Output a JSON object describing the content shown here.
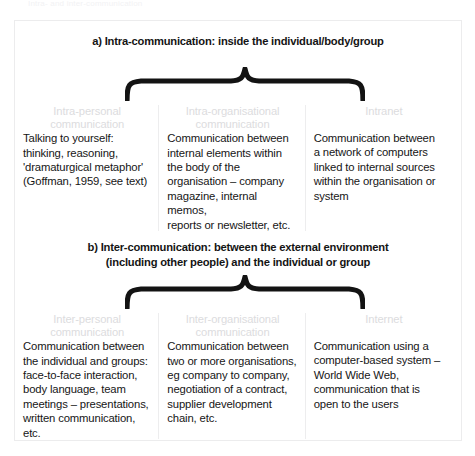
{
  "top_sliver": "Intra- and inter-communication",
  "figure": {
    "sections": [
      {
        "id": "a",
        "heading": "a) Intra-communication: inside the individual/body/group",
        "brace_icon": "curly-brace-icon",
        "columns": [
          {
            "header": "Intra-personal\ncommunication",
            "body": "Talking to yourself:\nthinking, reasoning,\n'dramaturgical metaphor'\n(Goffman, 1959, see text)"
          },
          {
            "header": "Intra-organisational\ncommunication",
            "body": "Communication between\ninternal elements within\nthe body of the\norganisation – company\nmagazine, internal memos,\nreports or newsletter, etc."
          },
          {
            "header": "Intranet",
            "body": "Communication between\na network of computers\nlinked to internal sources\nwithin the organisation or\nsystem"
          }
        ]
      },
      {
        "id": "b",
        "heading": "b) Inter-communication: between the external environment\n(including other people) and the individual or group",
        "brace_icon": "curly-brace-icon",
        "columns": [
          {
            "header": "Inter-personal\ncommunication",
            "body": "Communication between\nthe individual and groups:\nface-to-face interaction,\nbody language, team\nmeetings – presentations,\nwritten communication,\netc."
          },
          {
            "header": "Inter-organisational\ncommunication",
            "body": "Communication between\ntwo or more organisations,\neg company to company,\nnegotiation of a contract,\nsupplier development\nchain, etc."
          },
          {
            "header": "Internet",
            "body": "Communication using a\ncomputer-based system –\nWorld Wide Web,\ncommunication that is\nopen to the users"
          }
        ]
      }
    ]
  },
  "colors": {
    "body_text": "#161616",
    "header_text": "#dcdcde",
    "frame_border": "#ececed",
    "divider": "#ededee",
    "brace": "#131313",
    "background": "#ffffff"
  }
}
